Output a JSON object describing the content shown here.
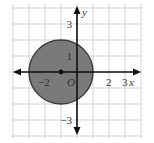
{
  "diagram": {
    "type": "coordinate-plane",
    "x_range": [
      -4,
      4
    ],
    "y_range": [
      -4,
      4
    ],
    "grid_step": 1,
    "axis_labels": {
      "x": "x",
      "y": "y",
      "origin": "O"
    },
    "x_tick_labels": [
      {
        "value": -2,
        "text": "−2"
      },
      {
        "value": 2,
        "text": "2"
      },
      {
        "value": 3,
        "text": "3"
      }
    ],
    "y_tick_labels": [
      {
        "value": 3,
        "text": "3"
      },
      {
        "value": 1,
        "text": "1"
      },
      {
        "value": -3,
        "text": "−3"
      }
    ],
    "circle": {
      "center": [
        -1,
        0
      ],
      "radius": 2,
      "fill": "#7a7a7a",
      "stroke": "#3a3a3a",
      "center_point": true
    },
    "colors": {
      "grid": "#c8c8c8",
      "axis": "#111111",
      "background": "#ffffff"
    }
  }
}
